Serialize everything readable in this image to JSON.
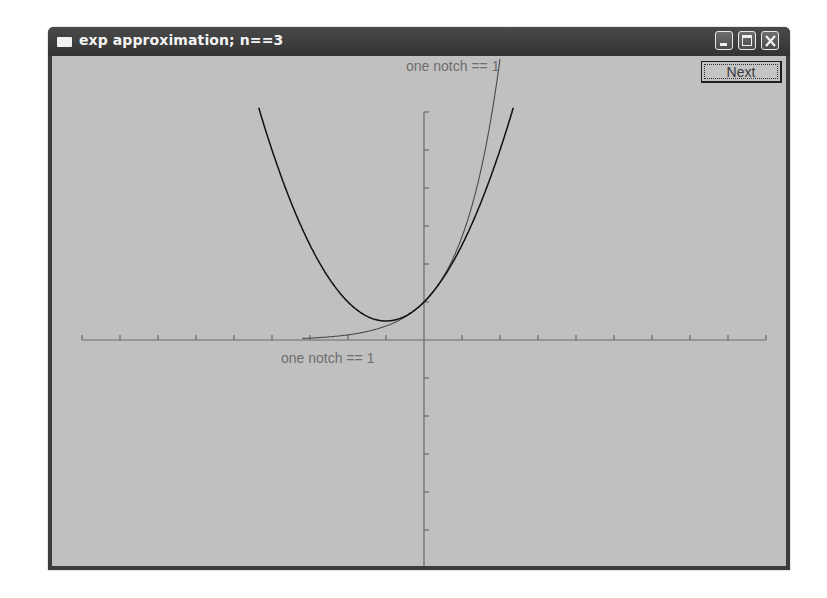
{
  "window": {
    "title": "exp approximation; n==3",
    "controls": {
      "minimize": "minimize-icon",
      "maximize": "maximize-icon",
      "close": "close-icon"
    }
  },
  "toolbar": {
    "next_label": "Next"
  },
  "axes": {
    "x_label": "one notch == 1",
    "y_label": "one notch == 1"
  },
  "colors": {
    "background": "#c0c0c0",
    "axis": "#6a6a6a",
    "exp_curve": "#4a4a4a",
    "approx_curve": "#101010",
    "label": "#6e6e6e"
  },
  "chart_data": {
    "type": "line",
    "title": "exp approximation; n==3",
    "xlabel": "one notch == 1",
    "ylabel": "one notch == 1",
    "xlim": [
      -9,
      9
    ],
    "ylim": [
      -6,
      6
    ],
    "grid": false,
    "origin_px": [
      372,
      284
    ],
    "scale_px_per_unit": 38,
    "x_ticks": [
      -9,
      -8,
      -7,
      -6,
      -5,
      -4,
      -3,
      -2,
      -1,
      0,
      1,
      2,
      3,
      4,
      5,
      6,
      7,
      8,
      9
    ],
    "y_ticks": [
      -6,
      -5,
      -4,
      -3,
      -2,
      -1,
      0,
      1,
      2,
      3,
      4,
      5,
      6
    ],
    "series": [
      {
        "name": "exp(x)",
        "formula": "e^x",
        "x_range": [
          -3.2,
          2.25
        ],
        "points": [
          [
            -3,
            0.05
          ],
          [
            -2,
            0.14
          ],
          [
            -1,
            0.37
          ],
          [
            0,
            1.0
          ],
          [
            1,
            2.72
          ],
          [
            2,
            7.39
          ]
        ]
      },
      {
        "name": "Taylor approximation n=3",
        "formula": "1 + x + x^2/2",
        "x_range": [
          -4.35,
          2.35
        ],
        "points": [
          [
            -4,
            5.0
          ],
          [
            -3,
            2.5
          ],
          [
            -2,
            1.0
          ],
          [
            -1,
            0.5
          ],
          [
            0,
            1.0
          ],
          [
            1,
            2.5
          ],
          [
            2,
            5.0
          ]
        ]
      }
    ]
  }
}
